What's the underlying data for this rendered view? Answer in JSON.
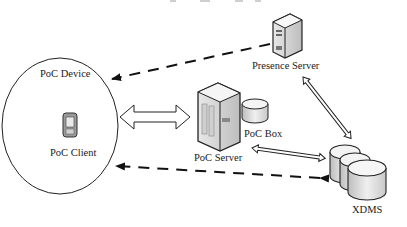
{
  "diagram": {
    "nodes": [
      {
        "id": "poc-device",
        "label": "PoC Device",
        "shape": "ellipse"
      },
      {
        "id": "poc-client",
        "label": "PoC Client",
        "icon": "mobile-phone-icon"
      },
      {
        "id": "poc-server",
        "label": "PoC Server",
        "icon": "server-tower-icon"
      },
      {
        "id": "poc-box",
        "label": "PoC Box",
        "icon": "database-cylinder-icon"
      },
      {
        "id": "presence-server",
        "label": "Presence Server",
        "icon": "server-tower-icon"
      },
      {
        "id": "xdms",
        "label": "XDMS",
        "icon": "database-stack-icon"
      }
    ],
    "edges": [
      {
        "from": "presence-server",
        "to": "poc-device",
        "style": "dashed",
        "arrow": "to"
      },
      {
        "from": "poc-device",
        "to": "poc-server",
        "style": "hollow-double-arrow",
        "arrow": "both"
      },
      {
        "from": "poc-box",
        "to": "xdms",
        "style": "hollow-double-arrow",
        "arrow": "both"
      },
      {
        "from": "presence-server",
        "to": "xdms",
        "style": "hollow-double-arrow",
        "arrow": "both"
      },
      {
        "from": "xdms",
        "to": "poc-device",
        "style": "dashed",
        "arrow": "both"
      }
    ]
  }
}
